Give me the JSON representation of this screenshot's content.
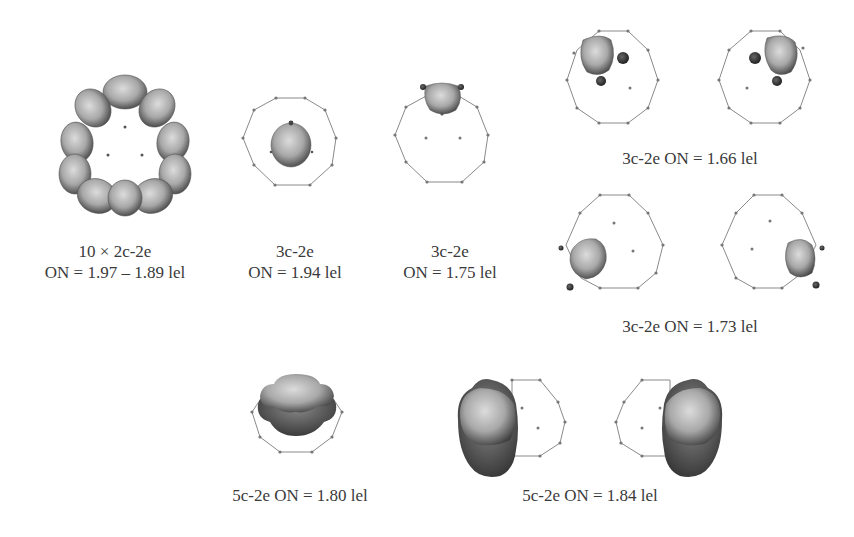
{
  "figure": {
    "panels": [
      {
        "id": "ring",
        "line1": "10 × 2c-2e",
        "line2": "ON = 1.97 – 1.89 lel"
      },
      {
        "id": "center",
        "line1": "3c-2e",
        "line2": "ON = 1.94 lel"
      },
      {
        "id": "top",
        "line1": "3c-2e",
        "line2": "ON = 1.75 lel"
      },
      {
        "id": "pair-upper",
        "line1": "3c-2e ON = 1.66 lel"
      },
      {
        "id": "pair-lower",
        "line1": "3c-2e ON = 1.73 lel"
      },
      {
        "id": "5c-single",
        "line1": "5c-2e ON = 1.80 lel"
      },
      {
        "id": "5c-pair",
        "line1": "5c-2e ON = 1.84 lel"
      }
    ],
    "colors": {
      "frame": "#8a8a8a",
      "lobe_light": "#d8d8d8",
      "lobe_dark": "#3c3c3c",
      "atom": "#555555"
    }
  }
}
